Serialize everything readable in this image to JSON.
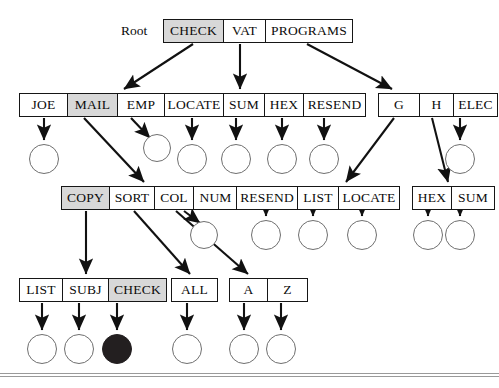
{
  "diagram": {
    "title_label": "Root",
    "rows": [
      {
        "name": "root-row",
        "groups": [
          {
            "x": 163,
            "y": 19,
            "h": 24,
            "cells": [
              {
                "label": "CHECK",
                "w": 60,
                "shaded": true
              },
              {
                "label": "VAT",
                "w": 42,
                "shaded": false
              },
              {
                "label": "PROGRAMS",
                "w": 86,
                "shaded": false
              }
            ]
          }
        ]
      },
      {
        "name": "level-1-row",
        "groups": [
          {
            "x": 19,
            "y": 93,
            "h": 24,
            "cells": [
              {
                "label": "JOE",
                "w": 48,
                "shaded": false
              },
              {
                "label": "MAIL",
                "w": 50,
                "shaded": true
              },
              {
                "label": "EMP",
                "w": 46,
                "shaded": false
              }
            ]
          },
          {
            "x": 164,
            "y": 93,
            "h": 24,
            "cells": [
              {
                "label": "LOCATE",
                "w": 59,
                "shaded": false
              },
              {
                "label": "SUM",
                "w": 41,
                "shaded": false
              },
              {
                "label": "HEX",
                "w": 39,
                "shaded": false
              },
              {
                "label": "RESEND",
                "w": 61,
                "shaded": false
              }
            ]
          },
          {
            "x": 378,
            "y": 93,
            "h": 24,
            "cells": [
              {
                "label": "G",
                "w": 41,
                "shaded": false
              },
              {
                "label": "H",
                "w": 34,
                "shaded": false
              },
              {
                "label": "ELEC",
                "w": 43,
                "shaded": false
              }
            ]
          }
        ]
      },
      {
        "name": "level-2-row",
        "groups": [
          {
            "x": 61,
            "y": 186,
            "h": 24,
            "cells": [
              {
                "label": "COPY",
                "w": 48,
                "shaded": true
              },
              {
                "label": "SORT",
                "w": 45,
                "shaded": false
              },
              {
                "label": "COL",
                "w": 39,
                "shaded": false
              },
              {
                "label": "NUM",
                "w": 43,
                "shaded": false
              }
            ]
          },
          {
            "x": 236,
            "y": 186,
            "h": 24,
            "cells": [
              {
                "label": "RESEND",
                "w": 61,
                "shaded": false
              },
              {
                "label": "LIST",
                "w": 41,
                "shaded": false
              },
              {
                "label": "LOCATE",
                "w": 60,
                "shaded": false
              }
            ]
          },
          {
            "x": 412,
            "y": 186,
            "h": 24,
            "cells": [
              {
                "label": "HEX",
                "w": 39,
                "shaded": false
              },
              {
                "label": "SUM",
                "w": 42,
                "shaded": false
              }
            ]
          }
        ]
      },
      {
        "name": "level-3-row",
        "groups": [
          {
            "x": 19,
            "y": 278,
            "h": 24,
            "cells": [
              {
                "label": "LIST",
                "w": 43,
                "shaded": false
              },
              {
                "label": "SUBJ",
                "w": 46,
                "shaded": false
              },
              {
                "label": "CHECK",
                "w": 57,
                "shaded": true
              }
            ]
          },
          {
            "x": 171,
            "y": 278,
            "h": 24,
            "cells": [
              {
                "label": "ALL",
                "w": 45,
                "shaded": false
              }
            ]
          },
          {
            "x": 229,
            "y": 278,
            "h": 24,
            "cells": [
              {
                "label": "A",
                "w": 38,
                "shaded": false
              },
              {
                "label": "Z",
                "w": 39,
                "shaded": false
              }
            ]
          }
        ]
      }
    ],
    "nodes": [
      {
        "id": "n1",
        "cx": 44,
        "cy": 159,
        "r": 15,
        "filled": false
      },
      {
        "id": "n2",
        "cx": 157,
        "cy": 148,
        "r": 14,
        "filled": false
      },
      {
        "id": "n3",
        "cx": 192,
        "cy": 159,
        "r": 15,
        "filled": false
      },
      {
        "id": "n4",
        "cx": 236,
        "cy": 159,
        "r": 15,
        "filled": false
      },
      {
        "id": "n5",
        "cx": 282,
        "cy": 159,
        "r": 15,
        "filled": false
      },
      {
        "id": "n6",
        "cx": 324,
        "cy": 159,
        "r": 15,
        "filled": false
      },
      {
        "id": "n7",
        "cx": 460,
        "cy": 159,
        "r": 15,
        "filled": false
      },
      {
        "id": "n8",
        "cx": 204,
        "cy": 235,
        "r": 14,
        "filled": false
      },
      {
        "id": "n9",
        "cx": 266,
        "cy": 235,
        "r": 15,
        "filled": false
      },
      {
        "id": "n10",
        "cx": 313,
        "cy": 235,
        "r": 15,
        "filled": false
      },
      {
        "id": "n11",
        "cx": 362,
        "cy": 235,
        "r": 15,
        "filled": false
      },
      {
        "id": "n12",
        "cx": 428,
        "cy": 235,
        "r": 15,
        "filled": false
      },
      {
        "id": "n13",
        "cx": 460,
        "cy": 235,
        "r": 15,
        "filled": false
      },
      {
        "id": "n14",
        "cx": 42,
        "cy": 349,
        "r": 15,
        "filled": false
      },
      {
        "id": "n15",
        "cx": 79,
        "cy": 349,
        "r": 15,
        "filled": false
      },
      {
        "id": "n16",
        "cx": 117,
        "cy": 349,
        "r": 15,
        "filled": true
      },
      {
        "id": "n17",
        "cx": 187,
        "cy": 349,
        "r": 15,
        "filled": false
      },
      {
        "id": "n18",
        "cx": 244,
        "cy": 349,
        "r": 15,
        "filled": false
      },
      {
        "id": "n19",
        "cx": 281,
        "cy": 349,
        "r": 15,
        "filled": false
      }
    ],
    "edges": [
      {
        "from": "CHECK",
        "to": "JOE-group",
        "x1": 193,
        "y1": 44,
        "x2": 124,
        "y2": 89
      },
      {
        "from": "VAT",
        "to": "LOCATE-group",
        "x1": 240,
        "y1": 44,
        "x2": 240,
        "y2": 89
      },
      {
        "from": "PROGRAMS",
        "to": "G-group",
        "x1": 307,
        "y1": 44,
        "x2": 392,
        "y2": 89
      },
      {
        "from": "JOE",
        "to": "n1",
        "x1": 44,
        "y1": 118,
        "x2": 44,
        "y2": 140
      },
      {
        "from": "MAIL",
        "to": "COPY-group",
        "x1": 84,
        "y1": 118,
        "x2": 144,
        "y2": 182
      },
      {
        "from": "EMP",
        "to": "n2",
        "x1": 131,
        "y1": 118,
        "x2": 150,
        "y2": 138
      },
      {
        "from": "LOCATE",
        "to": "n3",
        "x1": 192,
        "y1": 118,
        "x2": 192,
        "y2": 140
      },
      {
        "from": "SUM",
        "to": "n4",
        "x1": 236,
        "y1": 118,
        "x2": 236,
        "y2": 140
      },
      {
        "from": "HEX",
        "to": "n5",
        "x1": 282,
        "y1": 118,
        "x2": 282,
        "y2": 140
      },
      {
        "from": "RESEND",
        "to": "n6",
        "x1": 324,
        "y1": 118,
        "x2": 324,
        "y2": 140
      },
      {
        "from": "G",
        "to": "LOCATE-2",
        "x1": 394,
        "y1": 118,
        "x2": 346,
        "y2": 182
      },
      {
        "from": "H",
        "to": "HEX-2",
        "x1": 432,
        "y1": 118,
        "x2": 448,
        "y2": 182
      },
      {
        "from": "ELEC",
        "to": "n7",
        "x1": 460,
        "y1": 118,
        "x2": 460,
        "y2": 140
      },
      {
        "from": "COPY",
        "to": "LIST-3",
        "x1": 86,
        "y1": 211,
        "x2": 86,
        "y2": 274
      },
      {
        "from": "SORT",
        "to": "ALL",
        "x1": 134,
        "y1": 211,
        "x2": 190,
        "y2": 274
      },
      {
        "from": "COL",
        "to": "A",
        "x1": 176,
        "y1": 211,
        "x2": 248,
        "y2": 274
      },
      {
        "from": "NUM",
        "to": "n8",
        "x1": 184,
        "y1": 211,
        "x2": 200,
        "y2": 223
      },
      {
        "from": "RESEND-2",
        "to": "n9",
        "x1": 266,
        "y1": 211,
        "x2": 266,
        "y2": 216
      },
      {
        "from": "LIST-2",
        "to": "n10",
        "x1": 313,
        "y1": 211,
        "x2": 313,
        "y2": 216
      },
      {
        "from": "LOCATE-2",
        "to": "n11",
        "x1": 362,
        "y1": 211,
        "x2": 362,
        "y2": 216
      },
      {
        "from": "HEX-2",
        "to": "n12",
        "x1": 428,
        "y1": 211,
        "x2": 428,
        "y2": 216
      },
      {
        "from": "SUM-2",
        "to": "n13",
        "x1": 460,
        "y1": 211,
        "x2": 460,
        "y2": 216
      },
      {
        "from": "LIST-3",
        "to": "n14",
        "x1": 42,
        "y1": 303,
        "x2": 42,
        "y2": 330
      },
      {
        "from": "SUBJ",
        "to": "n15",
        "x1": 79,
        "y1": 303,
        "x2": 79,
        "y2": 330
      },
      {
        "from": "CHECK-3",
        "to": "n16",
        "x1": 117,
        "y1": 303,
        "x2": 117,
        "y2": 330
      },
      {
        "from": "ALL",
        "to": "n17",
        "x1": 187,
        "y1": 303,
        "x2": 187,
        "y2": 330
      },
      {
        "from": "A",
        "to": "n18",
        "x1": 244,
        "y1": 303,
        "x2": 244,
        "y2": 330
      },
      {
        "from": "Z",
        "to": "n19",
        "x1": 281,
        "y1": 303,
        "x2": 281,
        "y2": 330
      }
    ],
    "colors": {
      "shade": "#d8d8d8",
      "stroke": "#161616",
      "node_stroke": "#6f6f6f",
      "filled_node": "#231f20",
      "rule": "#9a9a9a"
    }
  }
}
